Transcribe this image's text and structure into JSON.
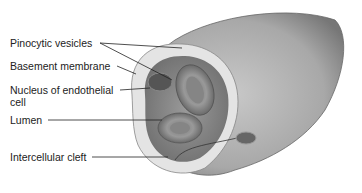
{
  "diagram": {
    "labels": [
      {
        "text": "Pinocytic vesicles"
      },
      {
        "text": "Basement membrane"
      },
      {
        "text": "Nucleus of endothelial"
      },
      {
        "text": "cell"
      },
      {
        "text": "Lumen"
      },
      {
        "text": "Intercellular cleft"
      }
    ]
  }
}
